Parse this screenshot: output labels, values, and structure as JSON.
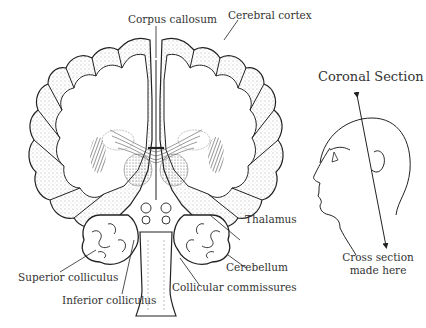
{
  "diagram": {
    "title": "Coronal Section",
    "labels": {
      "corpus_callosum": "Corpus callosum",
      "cerebral_cortex": "Cerebral cortex",
      "thalamus": "Thalamus",
      "cerebellum": "Cerebellum",
      "superior_colliculus": "Superior colliculus",
      "inferior_colliculus": "Inferior colliculus",
      "collicular_commissures": "Collicular commissures",
      "cross_section_line1": "Cross section",
      "cross_section_line2": "made here"
    },
    "colors": {
      "line": "#222222",
      "text": "#333333",
      "background": "#ffffff"
    }
  }
}
